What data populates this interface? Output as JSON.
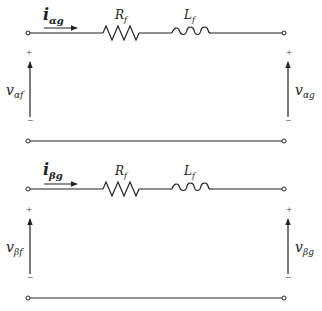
{
  "diagram": {
    "type": "circuit",
    "colors": {
      "line": "#222222",
      "background": "#ffffff"
    },
    "circuits": [
      {
        "id": "alpha",
        "current": {
          "symbol": "i",
          "subscript": "αg"
        },
        "resistor": {
          "symbol": "R",
          "subscript": "f"
        },
        "inductor": {
          "symbol": "L",
          "subscript": "f"
        },
        "left_voltage": {
          "symbol": "v",
          "subscript": "αf",
          "plus": "+",
          "minus": "−"
        },
        "right_voltage": {
          "symbol": "v",
          "subscript": "αg",
          "plus": "+",
          "minus": "−"
        }
      },
      {
        "id": "beta",
        "current": {
          "symbol": "i",
          "subscript": "βg"
        },
        "resistor": {
          "symbol": "R",
          "subscript": "f"
        },
        "inductor": {
          "symbol": "L",
          "subscript": "f"
        },
        "left_voltage": {
          "symbol": "v",
          "subscript": "βf",
          "plus": "+",
          "minus": "−"
        },
        "right_voltage": {
          "symbol": "v",
          "subscript": "βg",
          "plus": "+",
          "minus": "−"
        }
      }
    ]
  }
}
